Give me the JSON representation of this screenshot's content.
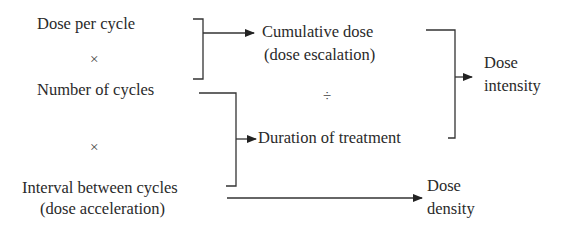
{
  "diagram": {
    "inputs": {
      "dose_per_cycle": "Dose per cycle",
      "op_multiply_1": "×",
      "number_of_cycles": "Number of cycles",
      "op_multiply_2": "×",
      "interval_line1": "Interval between cycles",
      "interval_line2": "(dose acceleration)"
    },
    "middle": {
      "cumulative_line1": "Cumulative dose",
      "cumulative_line2": "(dose escalation)",
      "op_divide": "÷",
      "duration": "Duration of treatment"
    },
    "outputs": {
      "intensity_line1": "Dose",
      "intensity_line2": "intensity",
      "density_line1": "Dose",
      "density_line2": "density"
    },
    "colors": {
      "line": "#333333",
      "text": "#2a2a2a"
    }
  }
}
